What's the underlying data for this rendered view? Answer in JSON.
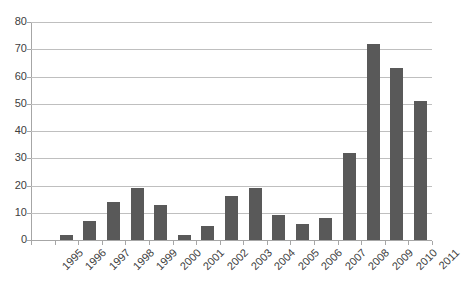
{
  "chart_data": {
    "type": "bar",
    "title": "",
    "subtitle": "",
    "xlabel": "",
    "ylabel": "",
    "categories": [
      "1995",
      "1996",
      "1997",
      "1998",
      "1999",
      "2000",
      "2001",
      "2002",
      "2003",
      "2004",
      "2005",
      "2006",
      "2007",
      "2008",
      "2009",
      "2010",
      "2011"
    ],
    "values": [
      0,
      2,
      7,
      14,
      19,
      13,
      2,
      5,
      16,
      19,
      9,
      6,
      8,
      32,
      72,
      63,
      51
    ],
    "series": [
      {
        "name": "",
        "values": [
          0,
          2,
          7,
          14,
          19,
          13,
          2,
          5,
          16,
          19,
          9,
          6,
          8,
          32,
          72,
          63,
          51
        ]
      }
    ],
    "ylim": [
      0,
      80
    ],
    "y_ticks": [
      0,
      10,
      20,
      30,
      40,
      50,
      60,
      70,
      80
    ],
    "y_tick_labels": [
      "0",
      "10",
      "20",
      "30",
      "40",
      "50",
      "60",
      "70",
      "80"
    ],
    "x_tick_labels": [
      "1995",
      "1996",
      "1997",
      "1998",
      "1999",
      "2000",
      "2001",
      "2002",
      "2003",
      "2004",
      "2005",
      "2006",
      "2007",
      "2008",
      "2009",
      "2010",
      "2011"
    ],
    "grid": true,
    "grid_axis": "y",
    "legend": false,
    "legend_position": "none",
    "annotations": [],
    "colors": {
      "bar_fill": "#595959",
      "gridline": "#bfbfbf",
      "axis_line": "#a6a6a6",
      "tick_label": "#404040",
      "background": "#ffffff"
    },
    "x_label_rotation_deg": -45
  }
}
